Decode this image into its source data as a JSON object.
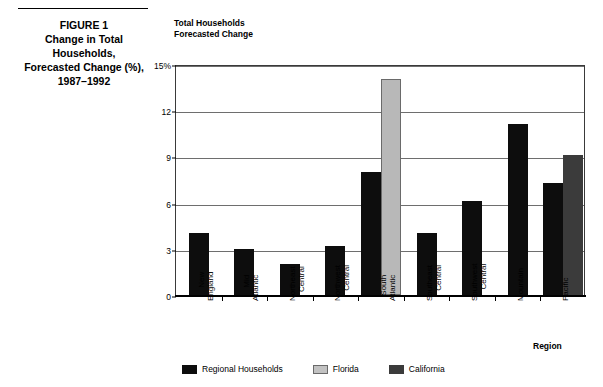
{
  "caption": {
    "figure_label": "FIGURE 1",
    "line1": "Change in Total",
    "line2": "Households,",
    "line3": "Forecasted Change (%),",
    "line4": "1987–1992"
  },
  "chart_header": {
    "line1": "Total Households",
    "line2": "Forecasted Change"
  },
  "legend": {
    "items": [
      {
        "label": "Regional Households",
        "color": "#0d0d0d"
      },
      {
        "label": "Florida",
        "color": "#c2c2c2"
      },
      {
        "label": "California",
        "color": "#3b3b3b"
      }
    ]
  },
  "chart_data": {
    "type": "bar",
    "title": "Total Households Forecasted Change",
    "subtitle": "Change in Total Households, Forecasted Change (%), 1987–1992",
    "xlabel": "Region",
    "ylabel": "",
    "ylim": [
      0,
      15
    ],
    "yticks": [
      0,
      3,
      6,
      9,
      12,
      15
    ],
    "ytick_labels": [
      "0",
      "3",
      "6",
      "9",
      "12",
      "15%"
    ],
    "grid": true,
    "legend_position": "bottom",
    "categories": [
      "New England",
      "Mid Atlantic",
      "Northeast Central",
      "Northwest Central",
      "South Atlantic",
      "Southeast Central",
      "Southwest Central",
      "Mountain",
      "Pacific"
    ],
    "category_lines": [
      [
        "New",
        "England"
      ],
      [
        "Mid",
        "Atlantic"
      ],
      [
        "Northeast",
        "Central"
      ],
      [
        "Northwest",
        "Central"
      ],
      [
        "South",
        "Atlantic"
      ],
      [
        "Southeast",
        "Central"
      ],
      [
        "Southwest",
        "Central"
      ],
      [
        "Mountain"
      ],
      [
        "Pacific"
      ]
    ],
    "series": [
      {
        "name": "Regional Households",
        "color": "#0d0d0d",
        "values": [
          4.0,
          3.0,
          2.0,
          3.2,
          8.0,
          4.0,
          6.1,
          11.1,
          7.3
        ]
      },
      {
        "name": "Florida",
        "color": "#c2c2c2",
        "values": [
          null,
          null,
          null,
          null,
          14.0,
          null,
          null,
          null,
          null
        ]
      },
      {
        "name": "California",
        "color": "#3b3b3b",
        "values": [
          null,
          null,
          null,
          null,
          null,
          null,
          null,
          null,
          9.1
        ]
      }
    ]
  }
}
